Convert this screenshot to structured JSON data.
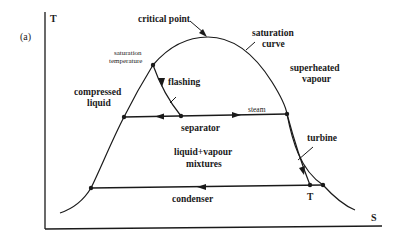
{
  "figure": {
    "panel_label": "(a)",
    "axes": {
      "y_label": "T",
      "x_label": "S"
    },
    "labels": {
      "critical_point": "critical point",
      "saturation_curve_1": "saturation",
      "saturation_curve_2": "curve",
      "saturation_temperature_1": "saturation",
      "saturation_temperature_2": "temperature",
      "superheated_1": "superheated",
      "superheated_2": "vapour",
      "compressed_1": "compressed",
      "compressed_2": "liquid",
      "flashing": "flashing",
      "steam": "steam",
      "separator": "separator",
      "turbine": "turbine",
      "mixture_1": "liquid+vapour",
      "mixture_2": "mixtures",
      "condenser": "condenser",
      "turbine_outlet": "T"
    },
    "colors": {
      "line": "#1a1a1a",
      "background": "#ffffff"
    }
  }
}
